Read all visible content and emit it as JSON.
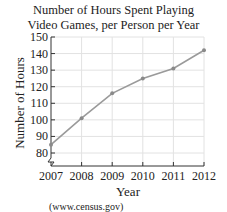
{
  "chart_data": {
    "type": "line",
    "title": "Number of Hours Spent Playing Video Games, per Person per Year",
    "title_lines": [
      "Number of Hours Spent Playing",
      "Video Games, per Person per Year"
    ],
    "xlabel": "Year",
    "ylabel": "Number of Hours",
    "categories": [
      "2007",
      "2008",
      "2009",
      "2010",
      "2011",
      "2012"
    ],
    "series": [
      {
        "name": "Hours per person",
        "values": [
          85,
          101,
          116,
          125,
          131,
          142
        ]
      }
    ],
    "yticks": [
      80,
      90,
      100,
      110,
      120,
      130,
      140,
      150
    ],
    "ylim": [
      80,
      150
    ],
    "y_axis_break": true,
    "grid": true,
    "legend": "none",
    "source": "(www.census.gov)",
    "line_color": "#9a9a9a",
    "grid_color": "#e2e2e2"
  }
}
